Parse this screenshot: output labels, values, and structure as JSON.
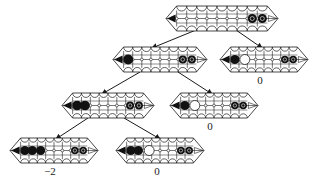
{
  "diagram": {
    "type": "game-tree",
    "colors": {
      "stroke": "#1a1a1a",
      "black_stone": "#111111",
      "background": "#ffffff"
    },
    "boards": [
      {
        "id": "root",
        "x": 166,
        "y": 6,
        "w": 112,
        "h": 25,
        "cells": 9,
        "left": [
          "tip"
        ],
        "right": [
          "b",
          "b"
        ],
        "white_big": [],
        "label": ""
      },
      {
        "id": "l1",
        "x": 113,
        "y": 47,
        "w": 94,
        "h": 25,
        "cells": 8,
        "left": [
          "tip",
          "b"
        ],
        "right": [
          "b",
          "b"
        ],
        "white_big": [],
        "label": ""
      },
      {
        "id": "r1",
        "x": 220,
        "y": 47,
        "w": 88,
        "h": 25,
        "cells": 8,
        "left": [
          "tip",
          "b"
        ],
        "right": [
          "b",
          "b"
        ],
        "white_big": [
          2
        ],
        "label": "0"
      },
      {
        "id": "l2",
        "x": 62,
        "y": 93,
        "w": 92,
        "h": 25,
        "cells": 8,
        "left": [
          "tip",
          "b",
          "b"
        ],
        "right": [
          "b",
          "b"
        ],
        "white_big": [],
        "label": ""
      },
      {
        "id": "r2",
        "x": 170,
        "y": 93,
        "w": 88,
        "h": 25,
        "cells": 8,
        "left": [
          "tip",
          "b"
        ],
        "right": [
          "b",
          "b"
        ],
        "white_big": [
          2
        ],
        "label": "0"
      },
      {
        "id": "l3",
        "x": 10,
        "y": 138,
        "w": 88,
        "h": 25,
        "cells": 8,
        "left": [
          "tip",
          "b",
          "b",
          "b"
        ],
        "right": [
          "b",
          "b"
        ],
        "white_big": [],
        "label": "−2"
      },
      {
        "id": "r3",
        "x": 116,
        "y": 138,
        "w": 88,
        "h": 25,
        "cells": 8,
        "left": [
          "tip",
          "b",
          "b"
        ],
        "right": [
          "b",
          "b"
        ],
        "white_big": [
          3
        ],
        "label": "0"
      }
    ],
    "edges": [
      {
        "from": "root",
        "to": "l1",
        "x1": 196,
        "y1": 30,
        "x2": 152,
        "y2": 48
      },
      {
        "from": "root",
        "to": "r1",
        "x1": 236,
        "y1": 30,
        "x2": 262,
        "y2": 48
      },
      {
        "from": "l1",
        "to": "l2",
        "x1": 140,
        "y1": 72,
        "x2": 102,
        "y2": 94
      },
      {
        "from": "l1",
        "to": "r2",
        "x1": 178,
        "y1": 72,
        "x2": 212,
        "y2": 94
      },
      {
        "from": "l2",
        "to": "l3",
        "x1": 88,
        "y1": 118,
        "x2": 56,
        "y2": 139
      },
      {
        "from": "l2",
        "to": "r3",
        "x1": 124,
        "y1": 118,
        "x2": 160,
        "y2": 139
      }
    ],
    "labels": [
      {
        "board": "r1",
        "text": "0",
        "x": 260,
        "y": 84
      },
      {
        "board": "r2",
        "text": "0",
        "x": 210,
        "y": 130
      },
      {
        "board": "l3",
        "text": "−2",
        "x": 50,
        "y": 175
      },
      {
        "board": "r3",
        "text": "0",
        "x": 157,
        "y": 175
      }
    ]
  }
}
